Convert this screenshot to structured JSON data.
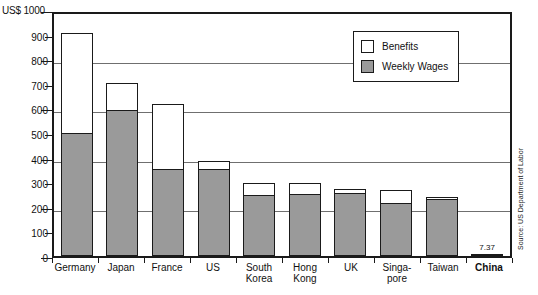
{
  "chart_data": {
    "type": "bar",
    "title": "",
    "subtitle": "",
    "xlabel": "",
    "ylabel": "US$ 1000",
    "axis_title": "US$ 1000",
    "ylim": [
      0,
      1000
    ],
    "ytick_step": 100,
    "gridline_values": [
      800,
      600,
      400,
      200
    ],
    "grid": true,
    "stacked": true,
    "legend_position": "top-right-inside",
    "categories": [
      "Germany",
      "Japan",
      "France",
      "US",
      "South\nKorea",
      "Hong\nKong",
      "UK",
      "Singa-\npore",
      "Taiwan",
      "China"
    ],
    "ytick_labels": [
      "0",
      "100",
      "200",
      "300",
      "400",
      "500",
      "600",
      "700",
      "800",
      "900",
      "US$ 1000"
    ],
    "series": [
      {
        "name": "Weekly Wages",
        "color": "#9a9a9a",
        "values": [
          500,
          593,
          355,
          355,
          250,
          252,
          256,
          215,
          232,
          7.37
        ]
      },
      {
        "name": "Benefits",
        "color": "#ffffff",
        "values": [
          405,
          112,
          263,
          33,
          48,
          46,
          16,
          53,
          8,
          0
        ]
      }
    ],
    "totals": [
      905,
      705,
      618,
      388,
      298,
      298,
      272,
      268,
      240,
      7.37
    ],
    "data_labels": [
      {
        "category": "China",
        "text": "7.37",
        "value": 7.37
      }
    ],
    "annotations": {
      "source": "Source: US Department of Labor"
    },
    "bold_categories": [
      "China"
    ]
  },
  "legend": {
    "items": [
      {
        "label": "Benefits",
        "swatch": "benefits"
      },
      {
        "label": "Weekly Wages",
        "swatch": "wages"
      }
    ]
  },
  "colors": {
    "wages_fill": "#9a9a9a",
    "benefits_fill": "#ffffff",
    "outline": "#1a1a1a",
    "gridline": "#6f6f6f",
    "background": "#ffffff"
  }
}
